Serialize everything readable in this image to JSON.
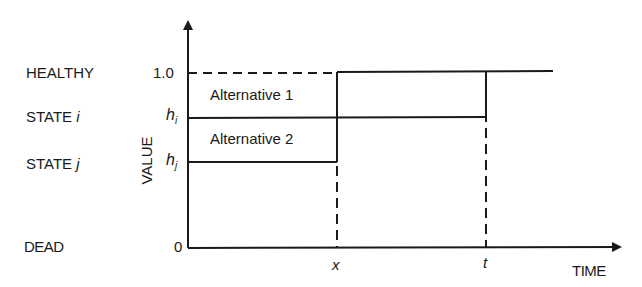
{
  "diagram": {
    "state_labels": {
      "healthy": "HEALTHY",
      "state_i_prefix": "STATE ",
      "state_i_var": "i",
      "state_j_prefix": "STATE ",
      "state_j_var": "j",
      "dead": "DEAD"
    },
    "y_ticks": {
      "one": "1.0",
      "h_i_base": "h",
      "h_i_sub": "i",
      "h_j_base": "h",
      "h_j_sub": "j",
      "zero": "0"
    },
    "y_axis_label": "VALUE",
    "x_axis_label": "TIME",
    "x_ticks": {
      "x": "x",
      "t": "t"
    },
    "regions": {
      "alt1": "Alternative 1",
      "alt2": "Alternative 2"
    },
    "colors": {
      "ink": "#1a1a1a",
      "background": "#ffffff"
    }
  }
}
